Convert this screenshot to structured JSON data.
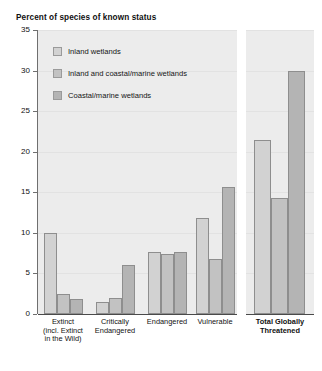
{
  "chart_data": {
    "type": "bar",
    "title": "Percent of species of known status",
    "xlabel": "",
    "ylabel": "",
    "ylim": [
      0,
      35
    ],
    "yticks": [
      0,
      5,
      10,
      15,
      20,
      25,
      30,
      35
    ],
    "grid": true,
    "legend_position": "top-left",
    "categories": [
      "Extinct\n(incl. Extinct\nin the Wild)",
      "Critically\nEndangered",
      "Endangered",
      "Vulnerable",
      "Total Globally\nThreatened"
    ],
    "series": [
      {
        "name": "Inland wetlands",
        "color": "#d2d2d2",
        "values": [
          10.0,
          1.5,
          7.6,
          11.8,
          21.5
        ]
      },
      {
        "name": "Inland and coastal/marine wetlands",
        "color": "#c2c2c2",
        "values": [
          2.5,
          2.0,
          7.4,
          6.8,
          14.3
        ]
      },
      {
        "name": "Coastal/marine wetlands",
        "color": "#b4b4b4",
        "values": [
          1.9,
          6.0,
          7.6,
          15.7,
          30.0
        ]
      }
    ]
  },
  "legend": {
    "items": [
      {
        "label": "Inland wetlands"
      },
      {
        "label": "Inland and coastal/marine wetlands"
      },
      {
        "label": "Coastal/marine wetlands"
      }
    ]
  },
  "axis": {
    "y_tick_labels": [
      "35",
      "30",
      "25",
      "20",
      "15",
      "10",
      "5",
      "0"
    ]
  },
  "categories_display": [
    {
      "line1": "Extinct",
      "line2": "(incl. Extinct",
      "line3": "in the Wild)"
    },
    {
      "line1": "Critically",
      "line2": "Endangered",
      "line3": ""
    },
    {
      "line1": "Endangered",
      "line2": "",
      "line3": ""
    },
    {
      "line1": "Vulnerable",
      "line2": "",
      "line3": ""
    },
    {
      "line1": "Total Globally",
      "line2": "Threatened",
      "line3": ""
    }
  ]
}
